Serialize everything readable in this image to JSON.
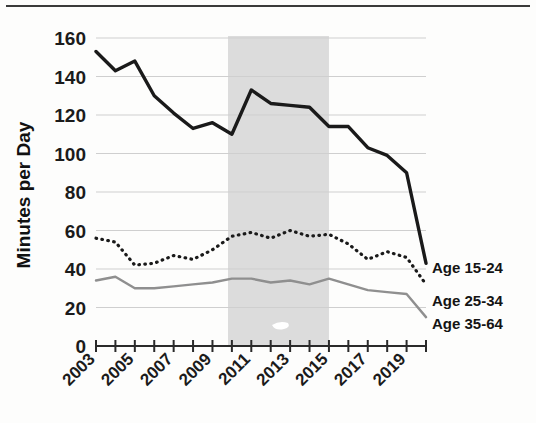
{
  "chart_data": {
    "type": "line",
    "title": "",
    "xlabel": "",
    "ylabel": "Minutes per Day",
    "ylim": [
      0,
      160
    ],
    "ytick_values": [
      0,
      20,
      40,
      60,
      80,
      100,
      120,
      140,
      160
    ],
    "ytick_labels": [
      "0",
      "20",
      "40",
      "60",
      "80",
      "100",
      "120",
      "140",
      "160"
    ],
    "xlim": [
      2003,
      2020
    ],
    "xtick_labels": [
      "2003",
      "2005",
      "2007",
      "2009",
      "2011",
      "2013",
      "2015",
      "2017",
      "2019"
    ],
    "xtick_values": [
      2003,
      2005,
      2007,
      2009,
      2011,
      2013,
      2015,
      2017,
      2019
    ],
    "minor_xticks": [
      2004,
      2006,
      2008,
      2010,
      2012,
      2014,
      2016,
      2018,
      2020
    ],
    "x": [
      2003,
      2004,
      2005,
      2006,
      2007,
      2008,
      2009,
      2010,
      2011,
      2012,
      2013,
      2014,
      2015,
      2016,
      2017,
      2018,
      2019,
      2020
    ],
    "grid": "horizontal",
    "legend_position": "right-inline",
    "series": [
      {
        "name": "Age 15-24",
        "style": "solid",
        "color": "#1a1a1a",
        "width": 3.4,
        "values": [
          153,
          143,
          148,
          130,
          121,
          113,
          116,
          110,
          133,
          126,
          125,
          124,
          114,
          114,
          103,
          99,
          90,
          43
        ]
      },
      {
        "name": "Age 25-34",
        "style": "dotted",
        "color": "#1a1a1a",
        "width": 3.2,
        "values": [
          56,
          54,
          42,
          43,
          47,
          45,
          50,
          57,
          59,
          56,
          60,
          57,
          58,
          53,
          45,
          49,
          46,
          32
        ]
      },
      {
        "name": "Age 35-64",
        "style": "solid",
        "color": "#8f8f8f",
        "width": 2.4,
        "values": [
          34,
          36,
          30,
          30,
          31,
          32,
          33,
          35,
          35,
          33,
          34,
          32,
          35,
          32,
          29,
          28,
          27,
          15
        ]
      }
    ],
    "shaded_region": {
      "label": "",
      "x_start": 2009.8,
      "x_end": 2015.0,
      "color": "#dcdcdc"
    },
    "annotations": [
      {
        "name": "Age 15-24",
        "text": "Age 15-24"
      },
      {
        "name": "Age 25-34",
        "text": "Age 25-34"
      },
      {
        "name": "Age 35-64",
        "text": "Age 35-64"
      }
    ]
  }
}
